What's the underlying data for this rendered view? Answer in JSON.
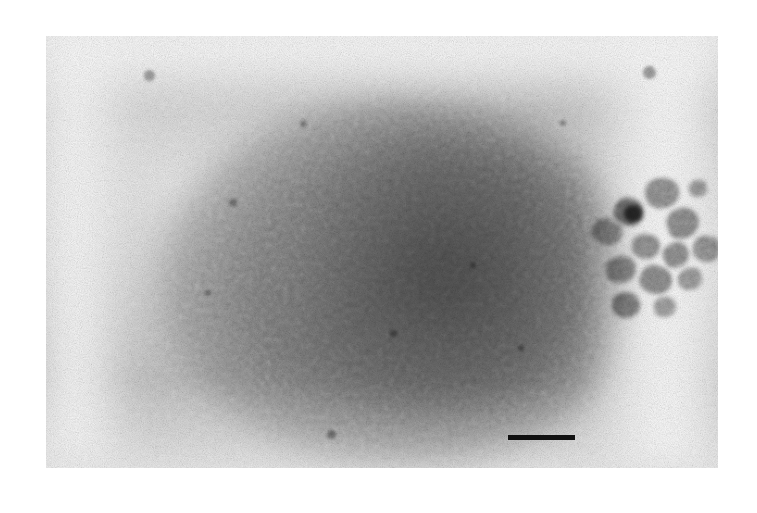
{
  "figure": {
    "kind": "electron-micrograph",
    "modality": "transmission electron microscopy, negative stain",
    "caption": "",
    "page_background": "#ffffff",
    "canvas": {
      "width": 757,
      "height": 513
    }
  },
  "micrograph": {
    "x": 46,
    "y": 36,
    "width": 672,
    "height": 432,
    "base_color": "#cdcdcd",
    "light_tone": "#ececec",
    "mid_tone": "#c2c2c2",
    "dark_tone": "#9b9b9b",
    "darkest_tone": "#6f6f6f"
  },
  "specimen": {
    "main_body": {
      "label": "large stained spherical body",
      "center_x": 352,
      "center_y": 248,
      "radius_x": 238,
      "radius_y": 182,
      "tone": "#9d9d9d"
    },
    "main_body_core": {
      "label": "dense core of stained body",
      "center_x": 400,
      "center_y": 240,
      "radius_x": 150,
      "radius_y": 140,
      "tone": "#9a9a9a"
    },
    "right_light_band": {
      "x": 540,
      "y": 0,
      "width": 140,
      "height": 432,
      "tone": "#f2f2f2"
    },
    "left_light_band": {
      "x": -20,
      "y": 0,
      "width": 110,
      "height": 432,
      "tone": "#f6f6f6"
    },
    "top_light_band": {
      "x": 0,
      "y": -30,
      "width": 672,
      "height": 90,
      "tone": "#f4f4f4"
    }
  },
  "aggregate": {
    "label": "cluster of electron-dense particles",
    "bounds": {
      "x": 592,
      "y": 172,
      "width": 128,
      "height": 150
    },
    "blobs": [
      {
        "x": 645,
        "y": 178,
        "w": 34,
        "h": 30,
        "tone": "#8f8f8f",
        "rot": -12
      },
      {
        "x": 614,
        "y": 198,
        "w": 30,
        "h": 28,
        "tone": "#767676",
        "rot": 18
      },
      {
        "x": 624,
        "y": 205,
        "w": 18,
        "h": 17,
        "tone": "#4e4e4e",
        "rot": 0
      },
      {
        "x": 592,
        "y": 219,
        "w": 30,
        "h": 26,
        "tone": "#9a9a9a",
        "rot": 25
      },
      {
        "x": 667,
        "y": 208,
        "w": 32,
        "h": 30,
        "tone": "#8b8b8b",
        "rot": -20
      },
      {
        "x": 632,
        "y": 234,
        "w": 28,
        "h": 25,
        "tone": "#929292",
        "rot": 8
      },
      {
        "x": 663,
        "y": 243,
        "w": 26,
        "h": 24,
        "tone": "#8d8d8d",
        "rot": -30
      },
      {
        "x": 693,
        "y": 236,
        "w": 27,
        "h": 26,
        "tone": "#969696",
        "rot": 14
      },
      {
        "x": 606,
        "y": 256,
        "w": 30,
        "h": 27,
        "tone": "#8e8e8e",
        "rot": -8
      },
      {
        "x": 640,
        "y": 266,
        "w": 32,
        "h": 28,
        "tone": "#8a8a8a",
        "rot": 22
      },
      {
        "x": 678,
        "y": 268,
        "w": 24,
        "h": 22,
        "tone": "#9b9b9b",
        "rot": -15
      },
      {
        "x": 612,
        "y": 292,
        "w": 28,
        "h": 26,
        "tone": "#858585",
        "rot": 10
      },
      {
        "x": 654,
        "y": 297,
        "w": 22,
        "h": 20,
        "tone": "#9d9d9d",
        "rot": -5
      },
      {
        "x": 689,
        "y": 180,
        "w": 18,
        "h": 17,
        "tone": "#9c9c9c",
        "rot": 0
      }
    ],
    "specks": [
      {
        "x": 144,
        "y": 70,
        "d": 11,
        "tone": "#a5a5a5"
      },
      {
        "x": 643,
        "y": 66,
        "d": 13,
        "tone": "#9d9d9d"
      },
      {
        "x": 327,
        "y": 430,
        "d": 9,
        "tone": "#9a9a9a"
      },
      {
        "x": 229,
        "y": 199,
        "d": 8,
        "tone": "#a0a0a0"
      },
      {
        "x": 390,
        "y": 330,
        "d": 7,
        "tone": "#a2a2a2"
      },
      {
        "x": 470,
        "y": 262,
        "d": 6,
        "tone": "#a0a0a0"
      },
      {
        "x": 300,
        "y": 120,
        "d": 7,
        "tone": "#a6a6a6"
      },
      {
        "x": 518,
        "y": 345,
        "d": 6,
        "tone": "#a4a4a4"
      },
      {
        "x": 205,
        "y": 290,
        "d": 6,
        "tone": "#a4a4a4"
      },
      {
        "x": 560,
        "y": 120,
        "d": 6,
        "tone": "#a6a6a6"
      }
    ]
  },
  "scale_bar": {
    "label": "",
    "has_label": false,
    "x": 508,
    "y": 435,
    "width": 67,
    "height": 5,
    "color": "#111111"
  }
}
